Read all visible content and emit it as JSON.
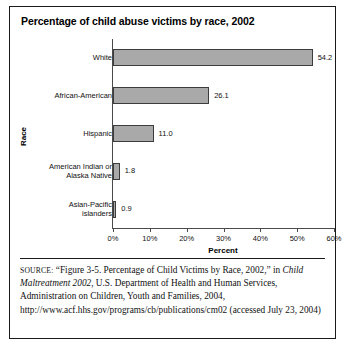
{
  "figure": {
    "title": "Percentage of child abuse victims by race, 2002"
  },
  "chart_data": {
    "type": "bar",
    "orientation": "horizontal",
    "title": "Percentage of child abuse victims by race, 2002",
    "categories": [
      "White",
      "African-American",
      "Hispanic",
      "American Indian or Alaska Native",
      "Asian-Pacific islanders"
    ],
    "category_lines": [
      [
        "White"
      ],
      [
        "African-American"
      ],
      [
        "Hispanic"
      ],
      [
        "American Indian or",
        "Alaska Native"
      ],
      [
        "Asian-Pacific",
        "islanders"
      ]
    ],
    "values": [
      54.2,
      26.1,
      11.0,
      1.8,
      0.9
    ],
    "data_labels": [
      "54.2",
      "26.1",
      "11.0",
      "1.8",
      "0.9"
    ],
    "xlabel": "Percent",
    "ylabel": "Race",
    "xlim": [
      0,
      60
    ],
    "xticks": [
      0,
      10,
      20,
      30,
      40,
      50,
      60
    ],
    "xtick_labels": [
      "0%",
      "10%",
      "20%",
      "30%",
      "40%",
      "50%",
      "60%"
    ],
    "grid": false,
    "legend": false,
    "bar_color": "#a9a9a9",
    "bar_border_color": "#3c3c3c",
    "axis_color": "#4a4a4a"
  },
  "source": {
    "label": "SOURCE:",
    "part1": " “Figure 3-5. Percentage of Child Victims by Race, 2002,” in ",
    "italic_title": "Child Maltreatment 2002",
    "part2": ", U.S. Department of Health and Human Services, Administration on Children, Youth and Families, 2004, http://www.acf.hhs.gov/programs/cb/publications/cm02 (accessed July 23, 2004)"
  }
}
